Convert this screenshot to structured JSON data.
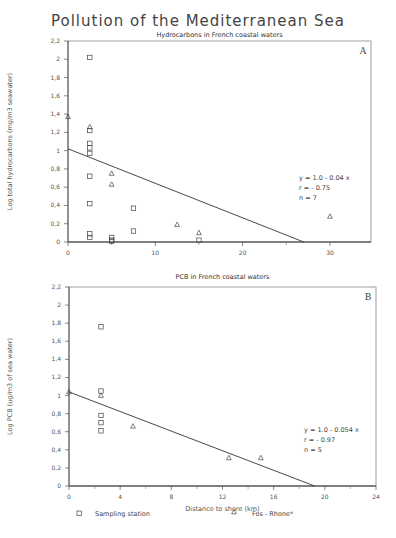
{
  "title": "Pollution of the Mediterranean Sea",
  "legend": {
    "square_label": "Sampling station",
    "triangle_label": "Fos - Rhone*"
  },
  "chart_data": [
    {
      "type": "scatter",
      "panel": "A",
      "title": "Hydrocarbons in French coastal waters",
      "xlabel": "",
      "ylabel": "Log total hydrocarbons (mg/m3 seawater)",
      "xlim": [
        0,
        34.7
      ],
      "ylim": [
        0,
        2.2
      ],
      "xticks": [
        0,
        10,
        20,
        30
      ],
      "yticks": [
        0,
        0.2,
        0.4,
        0.6,
        0.8,
        1,
        1.2,
        1.4,
        1.6,
        1.8,
        2,
        2.2
      ],
      "grid": false,
      "series": [
        {
          "name": "Sampling station",
          "marker": "square",
          "points": [
            [
              2.5,
              2.02
            ],
            [
              2.5,
              1.22
            ],
            [
              2.5,
              1.08
            ],
            [
              2.5,
              1.03
            ],
            [
              2.5,
              0.97
            ],
            [
              2.5,
              0.72
            ],
            [
              2.5,
              0.42
            ],
            [
              2.5,
              0.09
            ],
            [
              2.5,
              0.05
            ],
            [
              5,
              0.05
            ],
            [
              5,
              0.02
            ],
            [
              5,
              0.01
            ],
            [
              7.5,
              0.37
            ],
            [
              7.5,
              0.12
            ],
            [
              15,
              0.02
            ]
          ]
        },
        {
          "name": "Fos - Rhone*",
          "marker": "triangle",
          "points": [
            [
              0,
              1.37
            ],
            [
              2.5,
              1.26
            ],
            [
              5,
              0.75
            ],
            [
              5,
              0.63
            ],
            [
              12.5,
              0.19
            ],
            [
              15,
              0.1
            ],
            [
              30,
              0.28
            ]
          ]
        }
      ],
      "regression": {
        "equation": "y = 1.0 - 0.04 x",
        "r": "r = - 0.75",
        "n": "n =  7",
        "line": [
          [
            0,
            1.02
          ],
          [
            27,
            0.0
          ]
        ]
      }
    },
    {
      "type": "scatter",
      "panel": "B",
      "title": "PCB in French coastal waters",
      "xlabel": "Distance to shore (km)",
      "ylabel": "Log PCB (ug/m3 of sea water)",
      "xlim": [
        0,
        24
      ],
      "ylim": [
        0,
        2.2
      ],
      "xticks": [
        0,
        4,
        8,
        12,
        16,
        20,
        24
      ],
      "yticks": [
        0,
        0.2,
        0.4,
        0.6,
        0.8,
        1,
        1.2,
        1.4,
        1.6,
        1.8,
        2,
        2.2
      ],
      "grid": false,
      "series": [
        {
          "name": "Sampling station",
          "marker": "square",
          "points": [
            [
              2.5,
              1.76
            ],
            [
              2.5,
              1.05
            ],
            [
              2.5,
              0.78
            ],
            [
              2.5,
              0.7
            ],
            [
              2.5,
              0.61
            ]
          ]
        },
        {
          "name": "Fos - Rhone*",
          "marker": "triangle",
          "points": [
            [
              0,
              1.04
            ],
            [
              2.5,
              1.0
            ],
            [
              5,
              0.66
            ],
            [
              12.5,
              0.31
            ],
            [
              15,
              0.31
            ]
          ]
        }
      ],
      "regression": {
        "equation": "y = 1.0 - 0.054 x",
        "r": "r = - 0.97",
        "n": "n =  5",
        "line": [
          [
            0,
            1.04
          ],
          [
            19.2,
            0.0
          ]
        ]
      }
    }
  ]
}
